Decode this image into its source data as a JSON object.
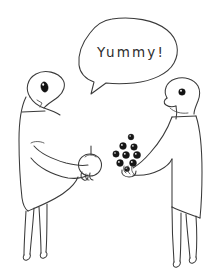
{
  "canvas": {
    "width": 211,
    "height": 279,
    "background_color": "#ffffff",
    "ink_color": "#3a3a3a",
    "style": "hand-drawn line sketch"
  },
  "speech_bubble": {
    "text": "Yummy!",
    "speaker": "right-figure",
    "tail_direction": "down-left",
    "shape": "rounded-oval"
  },
  "figures": [
    {
      "id": "left-figure",
      "position": "left",
      "pose": "head tilted down, leaning forward, arm extended holding fruit",
      "eye": {
        "shape": "oval",
        "color": "#121212",
        "highlight": true
      },
      "holding": "apple",
      "legs": 2,
      "feet": 2
    },
    {
      "id": "right-figure",
      "position": "right",
      "pose": "standing upright facing left, arm extended offering berries",
      "eye": {
        "shape": "small-circle",
        "color": "#121212",
        "highlight": true
      },
      "holding": "berries",
      "legs": 2,
      "feet": 2
    }
  ],
  "objects": {
    "apple": {
      "label": "apple",
      "held_by": "left-figure",
      "has_stem": true,
      "fill": "#ffffff"
    },
    "berries": {
      "label": "berries",
      "held_by": "right-figure",
      "count": 9,
      "color": "#161616",
      "has_highlights": true,
      "arrangement": "loose cluster floating above hand"
    }
  },
  "scene_description": "Two hand-drawn bird-like characters exchanging fruit; the right one says Yummy!"
}
